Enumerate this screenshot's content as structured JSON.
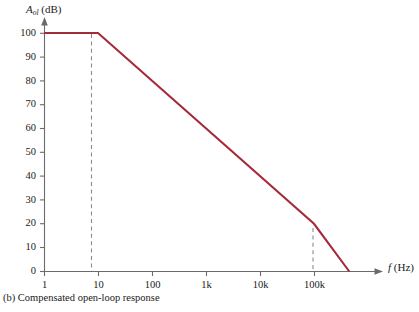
{
  "caption": "(b) Compensated open-loop response",
  "axes": {
    "y_title_symbol": "A",
    "y_title_sub": "ol",
    "y_title_unit": "(dB)",
    "x_title_symbol": "f",
    "x_title_unit": "(Hz)"
  },
  "chart_data": {
    "type": "line",
    "title": "(b) Compensated open-loop response",
    "xlabel": "f (Hz)",
    "ylabel": "Aol (dB)",
    "xscale": "log",
    "yscale": "linear",
    "xlim": [
      1,
      1000000
    ],
    "ylim": [
      0,
      100
    ],
    "grid": false,
    "legend": "none",
    "x_tick_labels": [
      "1",
      "10",
      "100",
      "1k",
      "10k",
      "100k"
    ],
    "x_tick_values": [
      1,
      10,
      100,
      1000,
      10000,
      100000
    ],
    "y_tick_labels": [
      "0",
      "10",
      "20",
      "30",
      "40",
      "50",
      "60",
      "70",
      "80",
      "90",
      "100"
    ],
    "y_tick_values": [
      0,
      10,
      20,
      30,
      40,
      50,
      60,
      70,
      80,
      90,
      100
    ],
    "series": [
      {
        "name": "Compensated open-loop gain",
        "color": "#A52A3A",
        "points": [
          {
            "f": 1,
            "gain_db": 100
          },
          {
            "f": 10,
            "gain_db": 100
          },
          {
            "f": 100000,
            "gain_db": 20
          },
          {
            "f": 450000,
            "gain_db": 0
          }
        ]
      }
    ],
    "annotations": [
      {
        "type": "dashed-vertical",
        "at_f": 10,
        "from_db": 0,
        "to_db": 100
      },
      {
        "type": "dashed-vertical",
        "at_f": 100000,
        "from_db": 0,
        "to_db": 20
      }
    ]
  },
  "y_ticks": [
    {
      "label": "100",
      "value": 100
    },
    {
      "label": "90",
      "value": 90
    },
    {
      "label": "80",
      "value": 80
    },
    {
      "label": "70",
      "value": 70
    },
    {
      "label": "60",
      "value": 60
    },
    {
      "label": "50",
      "value": 50
    },
    {
      "label": "40",
      "value": 40
    },
    {
      "label": "30",
      "value": 30
    },
    {
      "label": "20",
      "value": 20
    },
    {
      "label": "10",
      "value": 10
    },
    {
      "label": "0",
      "value": 0
    }
  ],
  "x_ticks": [
    {
      "label": "1",
      "value": 1
    },
    {
      "label": "10",
      "value": 10
    },
    {
      "label": "100",
      "value": 100
    },
    {
      "label": "1k",
      "value": 1000
    },
    {
      "label": "10k",
      "value": 10000
    },
    {
      "label": "100k",
      "value": 100000
    }
  ]
}
